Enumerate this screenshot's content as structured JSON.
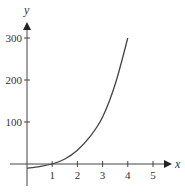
{
  "chart_data": {
    "type": "line",
    "title": "",
    "xlabel": "x",
    "ylabel": "y",
    "x_ticks": [
      "1",
      "2",
      "3",
      "4",
      "5"
    ],
    "y_ticks": [
      "100",
      "200",
      "300"
    ],
    "xlim": [
      0,
      5.7
    ],
    "ylim": [
      -40,
      340
    ],
    "grid": false,
    "legend": null,
    "series": [
      {
        "name": "f(x)",
        "x": [
          0,
          0.5,
          1,
          1.5,
          2,
          2.5,
          3,
          3.5,
          4
        ],
        "y": [
          -10,
          -6,
          0,
          12,
          33,
          65,
          112,
          190,
          300
        ]
      }
    ],
    "colors": {
      "axis": "#333333",
      "curve": "#444444"
    }
  }
}
